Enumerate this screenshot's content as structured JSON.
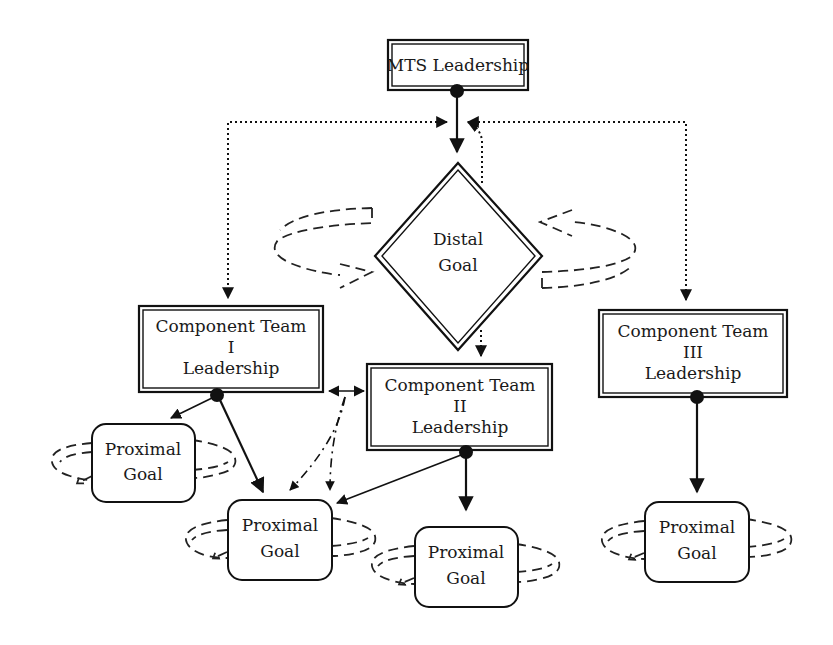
{
  "diagram": {
    "nodes": {
      "mts_leadership": {
        "label": "MTS Leadership"
      },
      "distal_goal": {
        "line1": "Distal",
        "line2": "Goal"
      },
      "team_1": {
        "line1": "Component Team",
        "line2": "I",
        "line3": "Leadership"
      },
      "team_2": {
        "line1": "Component Team",
        "line2": "II",
        "line3": "Leadership"
      },
      "team_3": {
        "line1": "Component Team",
        "line2": "III",
        "line3": "Leadership"
      },
      "proximal_goal_1": {
        "line1": "Proximal",
        "line2": "Goal"
      },
      "proximal_goal_2": {
        "line1": "Proximal",
        "line2": "Goal"
      },
      "proximal_goal_3": {
        "line1": "Proximal",
        "line2": "Goal"
      },
      "proximal_goal_4": {
        "line1": "Proximal",
        "line2": "Goal"
      }
    },
    "edges": [
      {
        "from": "MTS Leadership",
        "to": "Distal Goal",
        "style": "solid"
      },
      {
        "from": "Distal Goal",
        "to": "MTS Leadership",
        "style": "dotted"
      },
      {
        "from": "Component Team I Leadership",
        "to": "MTS Leadership",
        "style": "dotted"
      },
      {
        "from": "MTS Leadership",
        "to": "Component Team I Leadership",
        "style": "dotted"
      },
      {
        "from": "Component Team III Leadership",
        "to": "MTS Leadership",
        "style": "dotted"
      },
      {
        "from": "MTS Leadership",
        "to": "Component Team III Leadership",
        "style": "dotted"
      },
      {
        "from": "Distal Goal",
        "to": "Component Team II Leadership",
        "style": "dotted"
      },
      {
        "from": "Component Team I Leadership",
        "to": "Component Team II Leadership",
        "style": "solid-bidirectional"
      },
      {
        "from": "Component Team I Leadership",
        "to": "Proximal Goal (left)",
        "style": "solid"
      },
      {
        "from": "Component Team I Leadership",
        "to": "Proximal Goal (shared)",
        "style": "solid"
      },
      {
        "from": "Component Team II Leadership",
        "to": "Proximal Goal (shared)",
        "style": "solid"
      },
      {
        "from": "Component Team II Leadership",
        "to": "Proximal Goal (center)",
        "style": "solid"
      },
      {
        "from": "Component Team III Leadership",
        "to": "Proximal Goal (right)",
        "style": "solid"
      },
      {
        "from": "Team I–II link",
        "to": "Proximal Goal (shared)",
        "style": "dash-dot"
      }
    ],
    "colors": {
      "line": "#111111",
      "background": "#ffffff",
      "text": "#1a1a1a"
    }
  }
}
